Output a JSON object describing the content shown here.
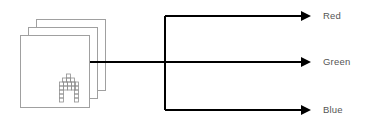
{
  "diagram": {
    "type": "image-channel-split",
    "source": {
      "name": "image-stack",
      "icon": "pixel-letter-a-icon",
      "layers": 3
    },
    "outputs": [
      {
        "label": "Red"
      },
      {
        "label": "Green"
      },
      {
        "label": "Blue"
      }
    ],
    "colors": {
      "line": "#000000",
      "sheet_border": "#a0a0a0",
      "label": "#555555",
      "pixel_border": "#909090"
    }
  }
}
